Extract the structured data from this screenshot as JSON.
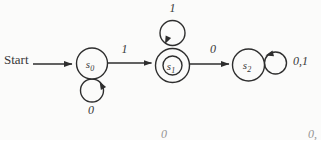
{
  "page": {
    "background": "#fbfbfa"
  },
  "colors": {
    "ink": "#2e2e2e",
    "text": "#383838",
    "faint": "#949494"
  },
  "diagram": {
    "type": "finite-state-automaton",
    "start_label": "Start",
    "states": [
      {
        "id": "s0",
        "base": "s",
        "sub": "0",
        "accepting": false
      },
      {
        "id": "s1",
        "base": "s",
        "sub": "1",
        "accepting": true
      },
      {
        "id": "s2",
        "base": "s",
        "sub": "2",
        "accepting": false
      }
    ],
    "transitions": [
      {
        "from": "start",
        "to": "s0",
        "label": ""
      },
      {
        "from": "s0",
        "to": "s1",
        "label": "1"
      },
      {
        "from": "s0",
        "to": "s0",
        "label": "0"
      },
      {
        "from": "s1",
        "to": "s1",
        "label": "1"
      },
      {
        "from": "s1",
        "to": "s2",
        "label": "0"
      },
      {
        "from": "s2",
        "to": "s2",
        "label": "0,1"
      }
    ],
    "page_fragments": {
      "bottom_center": "0",
      "bottom_right": "0,"
    }
  }
}
